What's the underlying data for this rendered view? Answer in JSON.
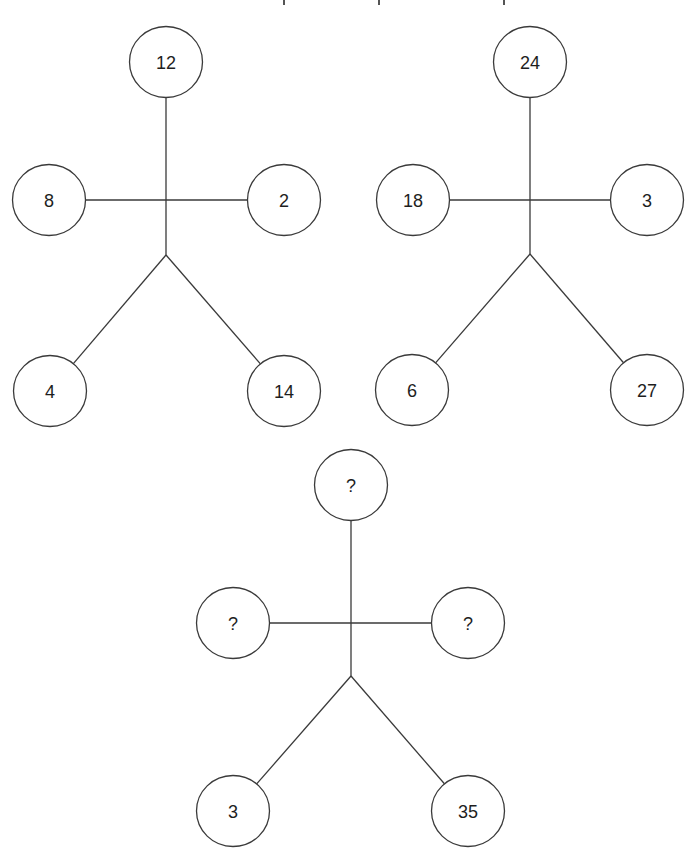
{
  "puzzle": {
    "type": "number-figure-puzzle",
    "node_radius": 36,
    "colors": {
      "background": "#ffffff",
      "stroke": "#3a3a3a",
      "text": "#1e1e1e"
    },
    "cropped_top_marks": [
      {
        "x": 283,
        "y": 0,
        "w": 2,
        "h": 5
      },
      {
        "x": 378,
        "y": 0,
        "w": 2,
        "h": 5
      },
      {
        "x": 503,
        "y": 0,
        "w": 2,
        "h": 5
      }
    ],
    "figures": [
      {
        "id": "figure-1",
        "spine": {
          "top": [
            166,
            98
          ],
          "fork": [
            166,
            255
          ]
        },
        "arms_y": 200,
        "nodes": {
          "head": {
            "label": "12",
            "cx": 166,
            "cy": 62
          },
          "left_arm": {
            "label": "8",
            "cx": 49,
            "cy": 200
          },
          "right_arm": {
            "label": "2",
            "cx": 284,
            "cy": 200
          },
          "left_leg": {
            "label": "4",
            "cx": 50,
            "cy": 391
          },
          "right_leg": {
            "label": "14",
            "cx": 284,
            "cy": 391
          }
        }
      },
      {
        "id": "figure-2",
        "spine": {
          "top": [
            530,
            98
          ],
          "fork": [
            530,
            254
          ]
        },
        "arms_y": 200,
        "nodes": {
          "head": {
            "label": "24",
            "cx": 530,
            "cy": 62
          },
          "left_arm": {
            "label": "18",
            "cx": 413,
            "cy": 200
          },
          "right_arm": {
            "label": "3",
            "cx": 647,
            "cy": 200
          },
          "left_leg": {
            "label": "6",
            "cx": 412,
            "cy": 390
          },
          "right_leg": {
            "label": "27",
            "cx": 647,
            "cy": 390
          }
        }
      },
      {
        "id": "figure-3",
        "spine": {
          "top": [
            351,
            521
          ],
          "fork": [
            351,
            676
          ]
        },
        "arms_y": 623,
        "nodes": {
          "head": {
            "label": "?",
            "cx": 351,
            "cy": 485
          },
          "left_arm": {
            "label": "?",
            "cx": 233,
            "cy": 623
          },
          "right_arm": {
            "label": "?",
            "cx": 468,
            "cy": 623
          },
          "left_leg": {
            "label": "3",
            "cx": 233,
            "cy": 811
          },
          "right_leg": {
            "label": "35",
            "cx": 468,
            "cy": 811
          }
        }
      }
    ]
  }
}
